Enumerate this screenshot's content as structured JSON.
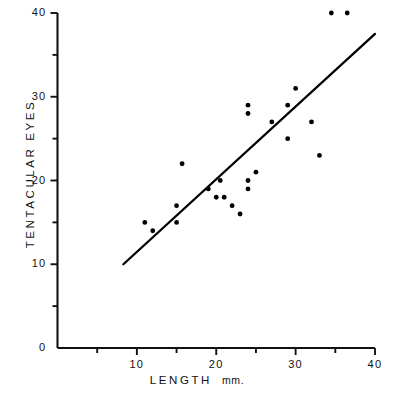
{
  "chart_data": {
    "type": "scatter",
    "title": "",
    "xlabel": "LENGTH",
    "xunit": "mm.",
    "ylabel": "TENTACULAR  EYES",
    "xlim": [
      0,
      40
    ],
    "ylim": [
      0,
      40
    ],
    "grid": false,
    "legend": null,
    "x_ticks": [
      0,
      5,
      10,
      15,
      20,
      25,
      30,
      35,
      40
    ],
    "x_tick_labels": [
      "",
      "",
      "10",
      "",
      "20",
      "",
      "30",
      "",
      "40"
    ],
    "y_ticks": [
      0,
      5,
      10,
      15,
      20,
      25,
      30,
      35,
      40
    ],
    "y_tick_labels": [
      "0",
      "",
      "10",
      "",
      "20",
      "",
      "30",
      "",
      "40"
    ],
    "marker": "filled-circle",
    "marker_color": "#000000",
    "points": [
      {
        "x": 11.0,
        "y": 15.0
      },
      {
        "x": 12.0,
        "y": 14.0
      },
      {
        "x": 15.0,
        "y": 15.0
      },
      {
        "x": 15.0,
        "y": 17.0
      },
      {
        "x": 15.7,
        "y": 22.0
      },
      {
        "x": 19.0,
        "y": 19.0
      },
      {
        "x": 20.0,
        "y": 18.0
      },
      {
        "x": 20.5,
        "y": 20.0
      },
      {
        "x": 21.0,
        "y": 18.0
      },
      {
        "x": 22.0,
        "y": 17.0
      },
      {
        "x": 23.0,
        "y": 16.0
      },
      {
        "x": 24.0,
        "y": 19.0
      },
      {
        "x": 24.0,
        "y": 20.0
      },
      {
        "x": 24.0,
        "y": 28.0
      },
      {
        "x": 24.0,
        "y": 29.0
      },
      {
        "x": 25.0,
        "y": 21.0
      },
      {
        "x": 27.0,
        "y": 27.0
      },
      {
        "x": 29.0,
        "y": 25.0
      },
      {
        "x": 29.0,
        "y": 29.0
      },
      {
        "x": 30.0,
        "y": 31.0
      },
      {
        "x": 32.0,
        "y": 27.0
      },
      {
        "x": 33.0,
        "y": 23.0
      },
      {
        "x": 34.5,
        "y": 40.0
      },
      {
        "x": 36.5,
        "y": 40.0
      }
    ],
    "fit_line": {
      "type": "regression-line",
      "x_start": 8.3,
      "y_start": 10.0,
      "x_end": 40.0,
      "y_end": 37.5,
      "color": "#000000"
    }
  }
}
